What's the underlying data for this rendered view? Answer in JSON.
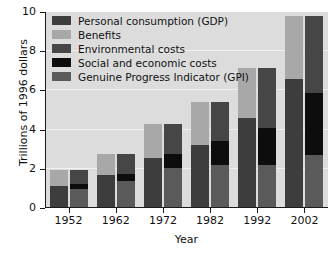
{
  "chart_data": {
    "type": "bar",
    "title": "",
    "subtitle": "",
    "xlabel": "Year",
    "ylabel": "Trillions of 1996 dollars",
    "categories": [
      "1952",
      "1962",
      "1972",
      "1982",
      "1992",
      "2002"
    ],
    "ylim": [
      0,
      10
    ],
    "yticks": [
      0,
      2,
      4,
      6,
      8,
      10
    ],
    "ytick_labels": [
      "0",
      "2",
      "4",
      "6",
      "8",
      "10"
    ],
    "grid": true,
    "grid_axis": "y",
    "legend_position": "upper-left-inside",
    "stacked": true,
    "grouped_pairs": true,
    "pair_note": "Left bar of each pair = GDP composition; right bar = GPI composition. Both bars of a pair share the same total.",
    "series": [
      {
        "name": "Personal consumption (GDP)",
        "color": "#3d3d3d",
        "bar": "left",
        "stack_order": 1,
        "values": [
          1.1,
          1.68,
          2.55,
          3.2,
          4.6,
          6.6
        ]
      },
      {
        "name": "Benefits",
        "color": "#a8a8a8",
        "bar": "left",
        "stack_order": 2,
        "values": [
          0.85,
          1.1,
          1.72,
          2.22,
          2.55,
          3.2
        ]
      },
      {
        "name": "Genuine Progress Indicator (GPI)",
        "color": "#5a5a5a",
        "bar": "right",
        "stack_order": 1,
        "values": [
          0.95,
          1.38,
          2.05,
          2.22,
          2.22,
          2.68
        ]
      },
      {
        "name": "Social and economic costs",
        "color": "#0d0d0d",
        "bar": "right",
        "stack_order": 2,
        "values": [
          0.3,
          0.35,
          0.7,
          1.2,
          1.85,
          3.2
        ]
      },
      {
        "name": "Environmental costs",
        "color": "#464646",
        "bar": "right",
        "stack_order": 3,
        "values": [
          0.7,
          1.05,
          1.52,
          2.0,
          3.08,
          3.92
        ]
      }
    ],
    "totals": [
      1.95,
      2.78,
      4.27,
      5.42,
      7.15,
      9.8
    ]
  },
  "legend": {
    "items": [
      {
        "label": "Personal consumption (GDP)",
        "color": "#3d3d3d"
      },
      {
        "label": "Benefits",
        "color": "#a8a8a8"
      },
      {
        "label": "Environmental costs",
        "color": "#464646"
      },
      {
        "label": "Social and economic costs",
        "color": "#0d0d0d"
      },
      {
        "label": "Genuine Progress Indicator (GPI)",
        "color": "#5a5a5a"
      }
    ]
  },
  "colors": {
    "plot_background": "#dcdcdc",
    "figure_background": "#ffffff",
    "axis": "#1a1a1a",
    "gridline": "#f0f0f0",
    "text": "#111111"
  }
}
